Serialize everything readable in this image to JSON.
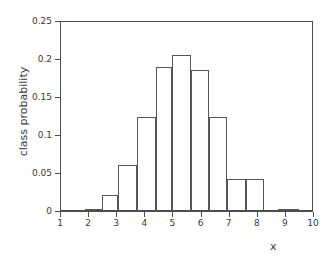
{
  "chart_data": {
    "type": "bar",
    "title": "",
    "subtitle": "",
    "xlabel": "x",
    "ylabel": "class probability",
    "xlim": [
      1,
      10
    ],
    "ylim": [
      0,
      0.25
    ],
    "grid": false,
    "legend": null,
    "xticks": [
      "1",
      "2",
      "3",
      "4",
      "5",
      "6",
      "7",
      "8",
      "9",
      "10"
    ],
    "xtick_values": [
      1,
      2,
      3,
      4,
      5,
      6,
      7,
      8,
      9,
      10
    ],
    "yticks": [
      "0",
      "0.05",
      "0.1",
      "0.15",
      "0.2",
      "0.25"
    ],
    "ytick_values": [
      0,
      0.05,
      0.1,
      0.15,
      0.2,
      0.25
    ],
    "bar_style": {
      "fill": "none",
      "edge_color": "#565656",
      "edge_width": 1
    },
    "bins": [
      {
        "x_start": 1.9,
        "x_end": 2.5,
        "value": 0.003
      },
      {
        "x_start": 2.5,
        "x_end": 3.05,
        "value": 0.021
      },
      {
        "x_start": 3.05,
        "x_end": 3.75,
        "value": 0.061
      },
      {
        "x_start": 3.75,
        "x_end": 4.4,
        "value": 0.124
      },
      {
        "x_start": 4.4,
        "x_end": 5.0,
        "value": 0.19
      },
      {
        "x_start": 5.0,
        "x_end": 5.65,
        "value": 0.205
      },
      {
        "x_start": 5.65,
        "x_end": 6.3,
        "value": 0.186
      },
      {
        "x_start": 6.3,
        "x_end": 6.95,
        "value": 0.124
      },
      {
        "x_start": 6.95,
        "x_end": 7.6,
        "value": 0.042
      },
      {
        "x_start": 7.6,
        "x_end": 8.25,
        "value": 0.042
      },
      {
        "x_start": 8.75,
        "x_end": 9.5,
        "value": 0.003
      }
    ],
    "categories": [
      "2.2",
      "2.8",
      "3.4",
      "4.1",
      "4.7",
      "5.3",
      "6.0",
      "6.6",
      "7.3",
      "7.9",
      "9.1"
    ],
    "values": [
      0.003,
      0.021,
      0.061,
      0.124,
      0.19,
      0.205,
      0.186,
      0.124,
      0.042,
      0.042,
      0.003
    ]
  }
}
